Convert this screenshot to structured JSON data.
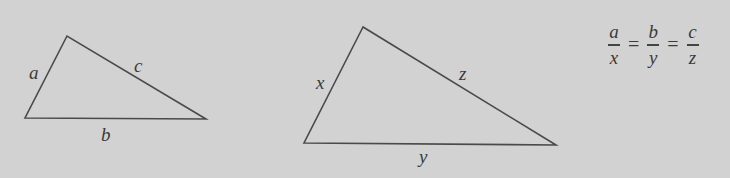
{
  "colors": {
    "background": "#d2d2d2",
    "line": "#4a4a4a",
    "text": "#3a3a3a"
  },
  "triangles": [
    {
      "name": "small-triangle",
      "vertices": [
        [
          67,
          36
        ],
        [
          25,
          118
        ],
        [
          206,
          119
        ]
      ],
      "sides": {
        "a": "a",
        "b": "b",
        "c": "c"
      }
    },
    {
      "name": "large-triangle",
      "vertices": [
        [
          363,
          27
        ],
        [
          304,
          143
        ],
        [
          556,
          145
        ]
      ],
      "sides": {
        "x": "x",
        "y": "y",
        "z": "z"
      }
    }
  ],
  "labels": {
    "a": "a",
    "b": "b",
    "c": "c",
    "x": "x",
    "y": "y",
    "z": "z"
  },
  "formula": {
    "frac1": {
      "num": "a",
      "den": "x"
    },
    "frac2": {
      "num": "b",
      "den": "y"
    },
    "frac3": {
      "num": "c",
      "den": "z"
    },
    "eq": "="
  }
}
